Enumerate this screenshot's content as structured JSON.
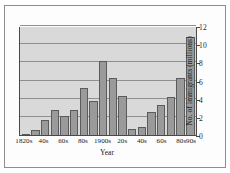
{
  "chart_data": {
    "type": "bar",
    "title": "",
    "xlabel": "Year",
    "ylabel": "No. of immigrants (millions)",
    "ylim": [
      0,
      12
    ],
    "yticks": [
      0,
      2,
      4,
      6,
      8,
      10,
      12
    ],
    "ytick_labels": [
      "0",
      "2",
      "4",
      "6",
      "8",
      "10",
      "12"
    ],
    "grid": true,
    "legend": "none",
    "categories": [
      "1820s",
      "30s",
      "40s",
      "50s",
      "60s",
      "70s",
      "80s",
      "90s",
      "1900s",
      "10s",
      "20s",
      "30s",
      "40s",
      "50s",
      "60s",
      "70s",
      "80s",
      "90s"
    ],
    "xtick_labels": [
      "1820s",
      "40s",
      "60s",
      "80s",
      "1900s",
      "20s",
      "40s",
      "60s",
      "80s",
      "90s"
    ],
    "xtick_indices": [
      0,
      2,
      4,
      6,
      8,
      10,
      12,
      14,
      16,
      17
    ],
    "values": [
      0.15,
      0.6,
      1.7,
      2.8,
      2.1,
      2.7,
      5.2,
      3.7,
      8.2,
      6.3,
      4.3,
      0.7,
      0.9,
      2.5,
      3.3,
      4.2,
      6.3,
      10.8
    ],
    "bar_color": "#9a9a9a",
    "bar_edge_color": "#5b5b5b",
    "plot_background": "#d9d9d9",
    "gridline_color": "#8f8f8f",
    "axis_color": "#4a4a4a",
    "frame_color": "#8e8e8e"
  }
}
